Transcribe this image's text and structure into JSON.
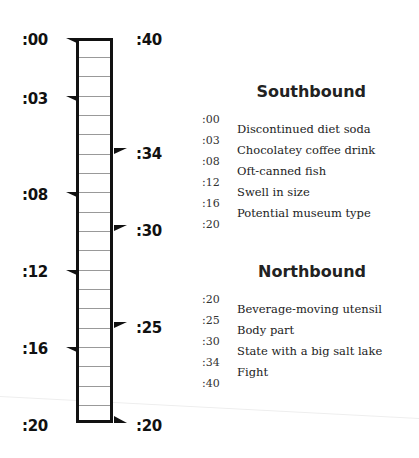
{
  "diagram": {
    "left_labels": [
      ":00",
      ":03",
      ":08",
      ":12",
      ":16",
      ":20"
    ],
    "right_labels": [
      ":40",
      ":34",
      ":30",
      ":25",
      ":20"
    ],
    "rows": 20
  },
  "southbound": {
    "heading": "Southbound",
    "times": [
      ":00",
      ":03",
      ":08",
      ":12",
      ":16",
      ":20"
    ],
    "clues": [
      "Discontinued diet soda",
      "Chocolatey coffee drink",
      "Oft-canned fish",
      "Swell in size",
      "Potential museum type"
    ]
  },
  "northbound": {
    "heading": "Northbound",
    "times": [
      ":20",
      ":25",
      ":30",
      ":34",
      ":40"
    ],
    "clues": [
      "Beverage-moving utensil",
      "Body part",
      "State with a big salt lake",
      "Fight"
    ]
  }
}
